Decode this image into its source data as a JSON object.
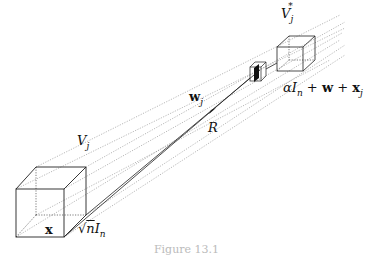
{
  "figure": {
    "caption": "Figure 13.1",
    "labels": {
      "V_j": {
        "main": "V",
        "sub": "j"
      },
      "V_j_star": {
        "main": "V",
        "sub": "j",
        "sup": "*"
      },
      "w_j": {
        "main": "w",
        "sub": "j"
      },
      "R": "R",
      "x": "x",
      "sqrt_n_In": {
        "root": "√",
        "radicand": "n",
        "main": "I",
        "sub": "n"
      },
      "alpha_expr": {
        "alpha": "α",
        "I": "I",
        "sub_n": "n",
        "plus1": " + ",
        "w": "w",
        "plus2": " + ",
        "x": "x",
        "sub_j": "j"
      }
    },
    "colors": {
      "ink": "#222222",
      "dotted": "#888888",
      "background": "#ffffff"
    }
  }
}
